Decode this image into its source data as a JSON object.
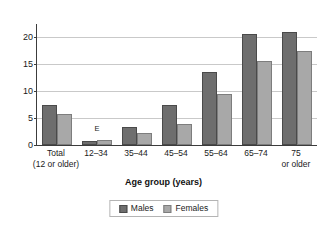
{
  "chart_data": {
    "type": "bar",
    "title": "",
    "xlabel": "Age group (years)",
    "ylabel": "",
    "ylim": [
      0,
      22.5
    ],
    "yticks": [
      0,
      5,
      10,
      15,
      20
    ],
    "ytick_labels": [
      "0",
      "5",
      "10",
      "15",
      "20"
    ],
    "grid": true,
    "legend_position": "bottom",
    "categories": [
      "Total\n(12 or older)",
      "12–34",
      "35–44",
      "45–54",
      "55–64",
      "65–74",
      "75\nor older"
    ],
    "category_labels": [
      {
        "line1": "Total",
        "line2": "(12 or older)"
      },
      {
        "line1": "12–34",
        "line2": ""
      },
      {
        "line1": "35–44",
        "line2": ""
      },
      {
        "line1": "45–54",
        "line2": ""
      },
      {
        "line1": "55–64",
        "line2": ""
      },
      {
        "line1": "65–74",
        "line2": ""
      },
      {
        "line1": "75",
        "line2": "or older"
      }
    ],
    "series": [
      {
        "name": "Males",
        "color": "#6e6e6e",
        "values": [
          7.5,
          0.7,
          3.3,
          7.5,
          13.5,
          20.7,
          21.0
        ]
      },
      {
        "name": "Females",
        "color": "#a8a8a8",
        "values": [
          5.7,
          0.9,
          2.3,
          3.9,
          9.4,
          15.6,
          17.4
        ]
      }
    ],
    "annotations": [
      {
        "text": "E",
        "category_index": 1,
        "value": 2.2
      }
    ]
  },
  "legend": {
    "items": [
      {
        "label": "Males",
        "swatch": "male"
      },
      {
        "label": "Females",
        "swatch": "female"
      }
    ]
  }
}
